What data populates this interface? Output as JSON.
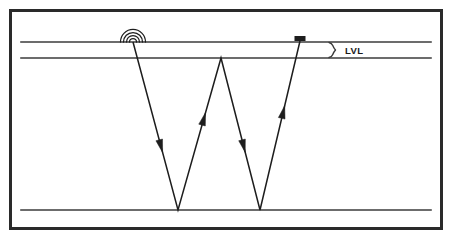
{
  "figure": {
    "kind": "seismic-ray-path-diagram",
    "background_color": "#ffffff",
    "line_color": "#3b3b3b",
    "ink_color": "#1d1d1d",
    "border": {
      "x": 10.5,
      "y": 10.5,
      "width": 431,
      "height": 218,
      "stroke_width": 3,
      "color": "#2a2a2a"
    }
  },
  "labels": {
    "lvl": "LVL"
  },
  "layers": [
    {
      "name": "ground-surface-line",
      "y": 42,
      "x1": 21,
      "x2": 431,
      "stroke_width": 1.6
    },
    {
      "name": "lvl-base-line",
      "y": 58,
      "x1": 21,
      "x2": 431,
      "stroke_width": 1.6
    },
    {
      "name": "refractor-line",
      "y": 210,
      "x1": 21,
      "x2": 431,
      "stroke_width": 1.6
    }
  ],
  "source": {
    "name": "seismic-source",
    "x": 133,
    "y": 42,
    "arc_count": 4,
    "arc_radii": [
      3.5,
      6.5,
      9.5,
      12.5
    ]
  },
  "receiver": {
    "name": "geophone-receiver",
    "x": 300,
    "y": 41,
    "width": 11,
    "height": 5
  },
  "brace": {
    "name": "lvl-brace",
    "x": 330,
    "y_top": 42,
    "y_bottom": 58,
    "label_x": 345,
    "label_y": 54
  },
  "raypath": {
    "name": "w-shaped-raypath",
    "vertices": [
      {
        "x": 133,
        "y": 42,
        "role": "source-point"
      },
      {
        "x": 178,
        "y": 210,
        "role": "bedrock-reflection-1"
      },
      {
        "x": 221,
        "y": 58,
        "role": "lvl-base-apex"
      },
      {
        "x": 260,
        "y": 210,
        "role": "bedrock-reflection-2"
      },
      {
        "x": 300,
        "y": 41,
        "role": "receiver-point"
      }
    ],
    "stroke_width": 1.5,
    "arrows": [
      {
        "name": "arrow-down-leg-1",
        "t": 0.62,
        "direction": "down"
      },
      {
        "name": "arrow-up-leg-2",
        "t": 0.6,
        "direction": "up"
      },
      {
        "name": "arrow-down-leg-3",
        "t": 0.58,
        "direction": "down"
      },
      {
        "name": "arrow-up-leg-4",
        "t": 0.58,
        "direction": "up"
      }
    ]
  }
}
